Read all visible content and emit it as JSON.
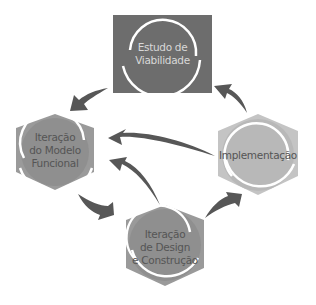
{
  "diagram": {
    "type": "cycle",
    "colors": {
      "dark_node": "#6d6d6d",
      "mid_node": "#9a9a9a",
      "light_node": "#c4c4c4",
      "arrow": "#575757",
      "arc": "#ffffff"
    },
    "nodes": [
      {
        "id": "viabilidade",
        "shape": "square",
        "line1": "Estudo de",
        "line2": "Viabilidade",
        "line3": ""
      },
      {
        "id": "modelo",
        "shape": "hexagon",
        "line1": "Iteração",
        "line2": "do Modelo",
        "line3": "Funcional"
      },
      {
        "id": "design",
        "shape": "hexagon",
        "line1": "Iteração",
        "line2": "de Design",
        "line3": "e Construção"
      },
      {
        "id": "implementacao",
        "shape": "hexagon",
        "line1": "Implementação",
        "line2": "",
        "line3": ""
      }
    ],
    "edges": [
      {
        "from": "viabilidade",
        "to": "modelo"
      },
      {
        "from": "modelo",
        "to": "design"
      },
      {
        "from": "design",
        "to": "modelo"
      },
      {
        "from": "design",
        "to": "implementacao"
      },
      {
        "from": "implementacao",
        "to": "modelo"
      },
      {
        "from": "implementacao",
        "to": "viabilidade"
      }
    ]
  }
}
